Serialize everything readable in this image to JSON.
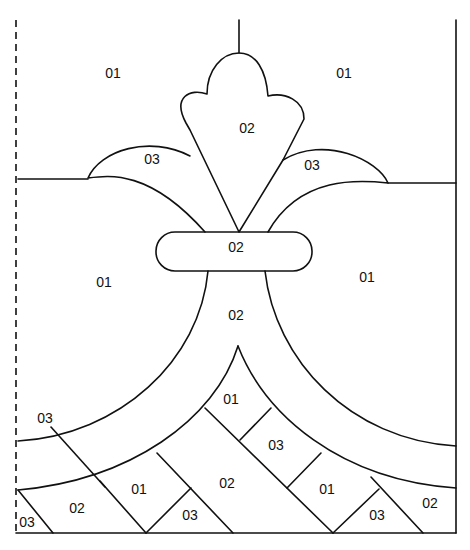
{
  "diagram": {
    "type": "stained-glass pattern",
    "line_color": "#111111",
    "background": "#ffffff",
    "labels": [
      {
        "id": "top-left-bg",
        "text": "01",
        "x": 113,
        "y": 74
      },
      {
        "id": "top-right-bg",
        "text": "01",
        "x": 344,
        "y": 74
      },
      {
        "id": "center-petal",
        "text": "02",
        "x": 247,
        "y": 129
      },
      {
        "id": "left-leaf",
        "text": "03",
        "x": 152,
        "y": 160
      },
      {
        "id": "right-leaf",
        "text": "03",
        "x": 312,
        "y": 166
      },
      {
        "id": "collar-band",
        "text": "02",
        "x": 236,
        "y": 248
      },
      {
        "id": "left-mid-bg",
        "text": "01",
        "x": 104,
        "y": 283
      },
      {
        "id": "right-mid-bg",
        "text": "01",
        "x": 367,
        "y": 278
      },
      {
        "id": "stem",
        "text": "02",
        "x": 236,
        "y": 316
      },
      {
        "id": "arch-top",
        "text": "01",
        "x": 231,
        "y": 400
      },
      {
        "id": "left-border-tag",
        "text": "03",
        "x": 45,
        "y": 419
      },
      {
        "id": "arch-right-1",
        "text": "03",
        "x": 276,
        "y": 446
      },
      {
        "id": "base-left",
        "text": "01",
        "x": 139,
        "y": 490
      },
      {
        "id": "base-center",
        "text": "02",
        "x": 227,
        "y": 484
      },
      {
        "id": "base-right",
        "text": "01",
        "x": 327,
        "y": 490
      },
      {
        "id": "bottom-left-big",
        "text": "02",
        "x": 77,
        "y": 509
      },
      {
        "id": "bottom-center",
        "text": "03",
        "x": 190,
        "y": 516
      },
      {
        "id": "bottom-right",
        "text": "03",
        "x": 377,
        "y": 516
      },
      {
        "id": "bottom-far-right",
        "text": "02",
        "x": 430,
        "y": 504
      },
      {
        "id": "corner-left",
        "text": "03",
        "x": 27,
        "y": 523
      }
    ]
  }
}
